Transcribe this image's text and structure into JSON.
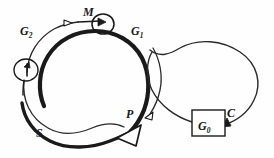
{
  "figure": {
    "background_color": "#fefefe",
    "ink_color": "#1a1a1a"
  },
  "labels": {
    "g1": {
      "text": "G",
      "sub": "1",
      "name": "g1-phase-label"
    },
    "g2": {
      "text": "G",
      "sub": "2",
      "name": "g2-phase-label"
    },
    "g0": {
      "text": "G",
      "sub": "0",
      "name": "g0-phase-label"
    },
    "m": {
      "text": "M",
      "sub": "",
      "name": "m-phase-label"
    },
    "s": {
      "text": "S",
      "sub": "",
      "name": "s-phase-label"
    },
    "p": {
      "text": "P",
      "sub": "",
      "name": "p-point-label"
    },
    "c": {
      "text": "C",
      "sub": "",
      "name": "c-label"
    }
  },
  "elements": {
    "main_cycle": "thick interrupted circle",
    "m_loop": "small circular arrow at top of cycle",
    "restriction_loop": "small circular arrow at left of cycle",
    "p_arrowhead": "large hollow triangular arrowhead",
    "g1_arrowhead": "small hollow arrowhead",
    "g2_arrowhead": "small hollow arrowhead",
    "c_arrowhead": "solid arrowhead",
    "g0_box": "rectangle",
    "right_loop": "large self-crossing loop"
  }
}
